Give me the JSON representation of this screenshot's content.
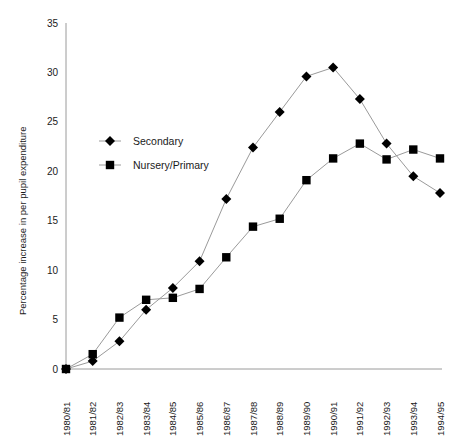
{
  "chart_data": {
    "type": "line",
    "title": "",
    "subtitle": "",
    "xlabel": "",
    "ylabel": "Percentage increase in per pupil expenditure",
    "categories": [
      "1980/81",
      "1981/82",
      "1982/83",
      "1983/84",
      "1984/85",
      "1985/86",
      "1986/87",
      "1987/88",
      "1988/89",
      "1989/90",
      "1990/91",
      "1991/92",
      "1992/93",
      "1993/94",
      "1994/95"
    ],
    "series": [
      {
        "name": "Secondary",
        "marker": "diamond",
        "color": "#000000",
        "values": [
          0,
          0.8,
          2.8,
          6.0,
          8.2,
          10.9,
          17.2,
          22.4,
          26.0,
          29.6,
          30.5,
          27.3,
          22.8,
          19.5,
          17.8
        ]
      },
      {
        "name": "Nursery/Primary",
        "marker": "square",
        "color": "#000000",
        "values": [
          0,
          1.5,
          5.2,
          7.0,
          7.2,
          8.1,
          11.3,
          14.4,
          15.2,
          19.1,
          21.3,
          22.8,
          21.2,
          22.2,
          21.3
        ]
      }
    ],
    "ylim": [
      0,
      35
    ],
    "yticks": [
      0,
      5,
      10,
      15,
      20,
      25,
      30,
      35
    ],
    "ytick_labels": [
      "0",
      "5",
      "10",
      "15",
      "20",
      "25",
      "30",
      "35"
    ],
    "grid": false,
    "legend_position": "upper-left-inside",
    "legend_entries": [
      "Secondary",
      "Nursery/Primary"
    ],
    "axis_color": "#9a9a9a",
    "line_color": "#9a9a9a",
    "marker_color": "#000000",
    "background_color": "#ffffff"
  }
}
